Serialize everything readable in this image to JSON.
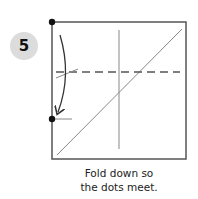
{
  "step": {
    "number": "5"
  },
  "caption": {
    "line1": "Fold down so",
    "line2": "the dots meet."
  },
  "colors": {
    "outline": "#555555",
    "crease": "#888888",
    "dot": "#111111",
    "badge": "#dcdcdc"
  },
  "diagram": {
    "square": {
      "x": 52,
      "y": 22,
      "w": 134,
      "h": 137
    },
    "dots": [
      {
        "x": 52,
        "y": 22
      },
      {
        "x": 52,
        "y": 119
      }
    ],
    "dashed_fold_line_y": 72,
    "vertical_crease_x": 119
  }
}
